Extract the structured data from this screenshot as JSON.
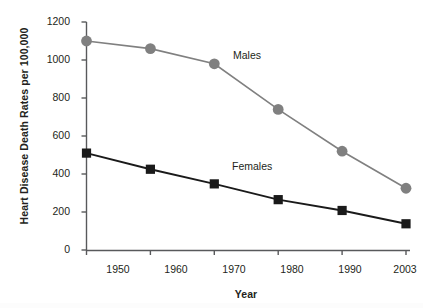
{
  "chart_data": {
    "type": "line",
    "title": "",
    "xlabel": "Year",
    "ylabel": "Heart Disease Death Rates per 100,000",
    "categories": [
      "1950",
      "1960",
      "1970",
      "1980",
      "1990",
      "2003"
    ],
    "x": [
      1950,
      1960,
      1970,
      1980,
      1990,
      2003
    ],
    "xtick_labels": [
      "1950",
      "1960",
      "1970",
      "1980",
      "1990",
      "2003"
    ],
    "ytick_labels": [
      "0",
      "200",
      "400",
      "600",
      "800",
      "1000",
      "1200"
    ],
    "yticks": [
      0,
      200,
      400,
      600,
      800,
      1000,
      1200
    ],
    "ylim": [
      0,
      1200
    ],
    "grid": false,
    "legend_position": "inline-annotation",
    "series": [
      {
        "name": "Males",
        "values": [
          1100,
          1060,
          980,
          740,
          520,
          325
        ],
        "color": "#808080",
        "marker": "circle",
        "annotation": "Males"
      },
      {
        "name": "Females",
        "values": [
          510,
          425,
          348,
          265,
          208,
          138
        ],
        "color": "#1a1a1a",
        "marker": "square",
        "annotation": "Females"
      }
    ],
    "annotations": [
      {
        "text": "Males",
        "series": "Males"
      },
      {
        "text": "Females",
        "series": "Females"
      }
    ]
  },
  "colors": {
    "males": "#808080",
    "females": "#1a1a1a",
    "axis": "#58595b",
    "background": "#ffffff"
  }
}
